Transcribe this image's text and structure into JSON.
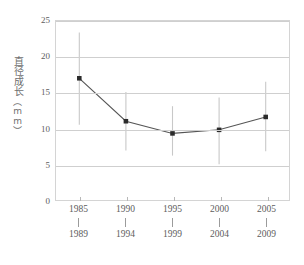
{
  "chart_data": {
    "type": "line",
    "title": "",
    "xlabel": "",
    "ylabel": "直径成长",
    "yunit": "（mm）",
    "ylim": [
      0,
      25
    ],
    "yticks": [
      0,
      5,
      10,
      15,
      20,
      25
    ],
    "grid": true,
    "legend": false,
    "categories": [
      "1985-1989",
      "1990-1994",
      "1995-1999",
      "2000-2004",
      "2005-2009"
    ],
    "category_starts": [
      "1985",
      "1990",
      "1995",
      "2000",
      "2005"
    ],
    "category_ends": [
      "1989",
      "1994",
      "1999",
      "2004",
      "2009"
    ],
    "values": [
      17.0,
      11.0,
      9.3,
      9.8,
      11.6
    ],
    "error_low": [
      10.5,
      6.9,
      6.2,
      5.0,
      6.8
    ],
    "error_high": [
      23.4,
      15.1,
      13.1,
      14.3,
      16.5
    ],
    "marker": "square",
    "series": [
      {
        "name": "直径成长",
        "values": [
          17.0,
          11.0,
          9.3,
          9.8,
          11.6
        ]
      }
    ]
  },
  "style": {
    "line_color": "#555555",
    "marker_color": "#2b2b2b",
    "error_color": "#c8c8c8",
    "grid_color": "#cfcfcf",
    "axis_color": "#d4d4d4",
    "text_color": "#5d5d5d",
    "background": "#ffffff"
  }
}
